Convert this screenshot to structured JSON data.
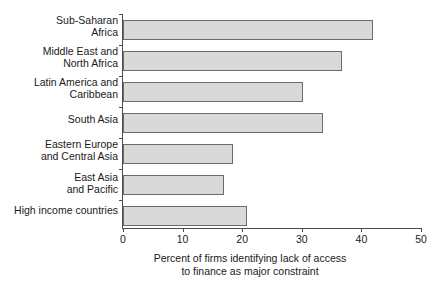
{
  "chart_data": {
    "type": "bar",
    "orientation": "horizontal",
    "title": "",
    "xlabel": "Percent of firms identifying lack of access\nto finance as major constraint",
    "ylabel": "",
    "xlim": [
      0,
      50
    ],
    "xticks": [
      0,
      10,
      20,
      30,
      40,
      50
    ],
    "xtick_labels": [
      "0",
      "10",
      "20",
      "30",
      "40",
      "50"
    ],
    "grid": false,
    "legend": null,
    "categories": [
      "Sub-Saharan\nAfrica",
      "Middle East and\nNorth Africa",
      "Latin America and\nCaribbean",
      "South Asia",
      "Eastern Europe\nand Central Asia",
      "East Asia\nand Pacific",
      "High income countries"
    ],
    "values": [
      42.0,
      36.7,
      30.2,
      33.5,
      18.5,
      17.0,
      20.8
    ],
    "bar_fill_color": "#d9d9d9",
    "bar_edge_color": "#6b6b6b",
    "axis_color": "#4c4c4c",
    "text_color": "#1a1a1a",
    "background_color": "#ffffff"
  }
}
